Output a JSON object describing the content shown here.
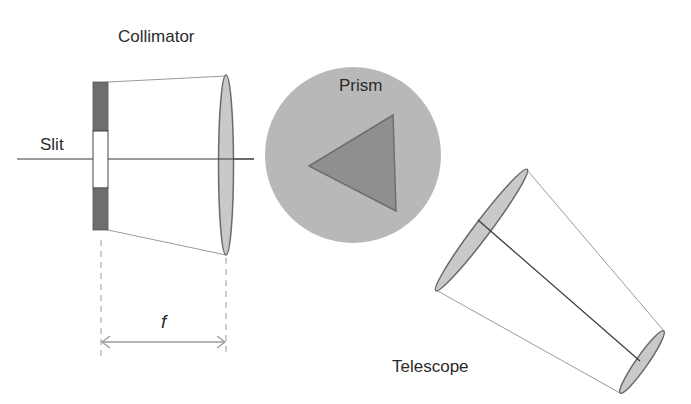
{
  "diagram": {
    "labels": {
      "collimator": "Collimator",
      "slit": "Slit",
      "prism": "Prism",
      "telescope": "Telescope",
      "focal_length": "f"
    },
    "colors": {
      "background": "#ffffff",
      "slit_bar": "#6e6e6e",
      "lens_fill": "#c9c9c9",
      "lens_stroke": "#6a6a6a",
      "prism_disc": "#b8b8b8",
      "prism_triangle": "#8f8f8f",
      "prism_triangle_stroke": "#707070",
      "lines": "#3a3a3a",
      "cone_lines": "#9a9a9a",
      "dashed": "#9a9a9a",
      "text": "#2b2b2b"
    }
  }
}
